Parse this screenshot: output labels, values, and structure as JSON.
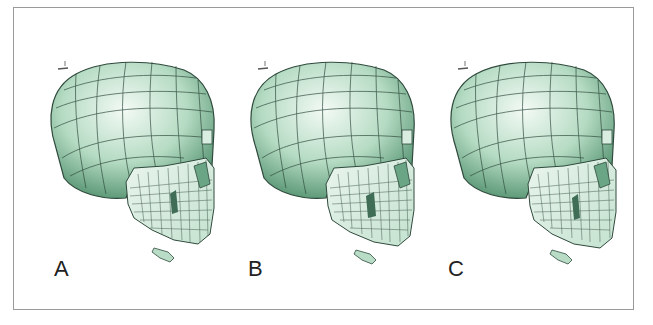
{
  "figure": {
    "panels": [
      {
        "id": "A",
        "label": "A"
      },
      {
        "id": "B",
        "label": "B"
      },
      {
        "id": "C",
        "label": "C"
      }
    ],
    "axis_glyph": {
      "label_x": "x",
      "label_y": "z"
    },
    "colors": {
      "skull_light": "#eef7f1",
      "skull_mid": "#a8d3b8",
      "skull_dark": "#4f8f6c",
      "mesh_line": "#2f4a3c",
      "border": "#9a9a9a"
    }
  }
}
